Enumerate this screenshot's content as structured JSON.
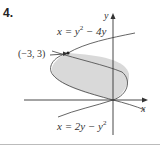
{
  "problem_number": "4.",
  "curves": [
    {
      "id": "top",
      "label_lhs": "x = y",
      "label_exp": "2",
      "label_rhs": " − 4y"
    },
    {
      "id": "bottom",
      "label_lhs": "x = 2y − y",
      "label_exp": "2",
      "label_rhs": ""
    }
  ],
  "point_label": "(−3, 3)",
  "axes": {
    "x": "x",
    "y": "y"
  },
  "colors": {
    "region_fill": "#d9d9d9",
    "curve": "#555555",
    "axis": "#333333"
  }
}
